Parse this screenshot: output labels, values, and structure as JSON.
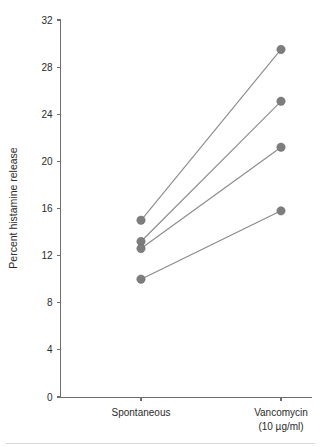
{
  "chart_data": {
    "type": "line",
    "title": "",
    "subtitle": "",
    "xlabel": "",
    "ylabel": "Percent histamine release",
    "categories": [
      "Spontaneous",
      "Vancomycin"
    ],
    "category_sublabels": [
      "",
      "(10 µg/ml)"
    ],
    "x": [
      0,
      1
    ],
    "ylim": [
      0,
      32
    ],
    "yticks": [
      0,
      4,
      8,
      12,
      16,
      20,
      24,
      28,
      32
    ],
    "ytick_labels": [
      "0",
      "4",
      "8",
      "12",
      "16",
      "20",
      "24",
      "28",
      "32"
    ],
    "grid": false,
    "legend": "none",
    "marker": "filled-circle",
    "marker_color": "#7d7d7d",
    "line_color": "#8a8a8a",
    "axis_color": "#6e6e6e",
    "series": [
      {
        "name": "Subject 1",
        "values": [
          15.0,
          29.5
        ]
      },
      {
        "name": "Subject 2",
        "values": [
          13.2,
          25.1
        ]
      },
      {
        "name": "Subject 3",
        "values": [
          12.6,
          21.2
        ]
      },
      {
        "name": "Subject 4",
        "values": [
          10.0,
          15.8
        ]
      }
    ]
  }
}
